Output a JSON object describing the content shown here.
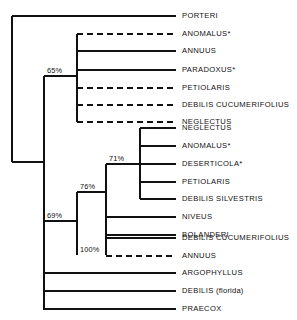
{
  "figure": {
    "type": "phylogenetic-tree",
    "background_color": "#ffffff",
    "line_color": "#111111",
    "width": 297,
    "height": 320
  },
  "chart_data": {
    "type": "tree",
    "title": "",
    "xlabel": "",
    "ylabel": "",
    "tips": [
      {
        "id": "t1",
        "label": "PORTERI",
        "qualifier": "",
        "style": "solid",
        "y": 16
      },
      {
        "id": "t2",
        "label": "ANOMALUS*",
        "qualifier": "",
        "style": "dashed",
        "y": 34
      },
      {
        "id": "t3",
        "label": "ANNUUS",
        "qualifier": "",
        "style": "solid",
        "y": 51
      },
      {
        "id": "t4",
        "label": "PARADOXUS*",
        "qualifier": "",
        "style": "solid",
        "y": 70
      },
      {
        "id": "t5",
        "label": "PETIOLARIS",
        "qualifier": "",
        "style": "dashed",
        "y": 88
      },
      {
        "id": "t6",
        "label": "DEBILIS CUCUMERIFOLIUS",
        "qualifier": "",
        "style": "dashed",
        "y": 105
      },
      {
        "id": "t7",
        "label": "NEGLECTUS",
        "qualifier": "",
        "style": "dashed",
        "y": 122
      },
      {
        "id": "t8",
        "label": "NEGLECTUS",
        "qualifier": "",
        "style": "solid",
        "y": 128
      },
      {
        "id": "t9",
        "label": "ANOMALUS*",
        "qualifier": "",
        "style": "solid",
        "y": 146
      },
      {
        "id": "t10",
        "label": "DESERTICOLA*",
        "qualifier": "",
        "style": "solid",
        "y": 164
      },
      {
        "id": "t11",
        "label": "PETIOLARIS",
        "qualifier": "",
        "style": "solid",
        "y": 182
      },
      {
        "id": "t12",
        "label": "DEBILIS SILVESTRIS",
        "qualifier": "",
        "style": "solid",
        "y": 199
      },
      {
        "id": "t13",
        "label": "NIVEUS",
        "qualifier": "",
        "style": "solid",
        "y": 217
      },
      {
        "id": "t14",
        "label": "BOLANDERI",
        "qualifier": "",
        "style": "solid",
        "y": 235
      },
      {
        "id": "t15",
        "label": "DEBILIS CUCUMERIFOLIUS",
        "qualifier": "",
        "style": "solid",
        "y": 238
      },
      {
        "id": "t16",
        "label": "ANNUUS",
        "qualifier": "",
        "style": "dashed",
        "y": 256
      },
      {
        "id": "t17",
        "label": "ARGOPHYLLUS",
        "qualifier": "",
        "style": "solid",
        "y": 273
      },
      {
        "id": "t18",
        "label": "DEBILIS",
        "qualifier": "(florida)",
        "style": "solid",
        "y": 291
      },
      {
        "id": "t19",
        "label": "PRAECOX",
        "qualifier": "",
        "style": "solid",
        "y": 309
      }
    ],
    "support_values": [
      {
        "id": "n65",
        "label": "65%",
        "x": 47,
        "y": 76
      },
      {
        "id": "n71",
        "label": "71%",
        "x": 109,
        "y": 164
      },
      {
        "id": "n76",
        "label": "76%",
        "x": 80,
        "y": 192
      },
      {
        "id": "n69",
        "label": "69%",
        "x": 47,
        "y": 221
      },
      {
        "id": "n100",
        "label": "100%",
        "x": 80,
        "y": 255
      }
    ]
  },
  "geometry": {
    "tip_x": 176,
    "label_x": 182,
    "verticals": [
      {
        "name": "root-spine",
        "x": 12,
        "y1": 16,
        "y2": 162
      },
      {
        "name": "ingroup-spine",
        "x": 44,
        "y1": 76,
        "y2": 310
      },
      {
        "name": "clade-65-spine",
        "x": 77,
        "y1": 34,
        "y2": 122
      },
      {
        "name": "clade-76-spine",
        "x": 77,
        "y1": 192,
        "y2": 255
      },
      {
        "name": "clade-71-spine",
        "x": 106,
        "y1": 164,
        "y2": 255
      },
      {
        "name": "clade-71-tipspine",
        "x": 140,
        "y1": 128,
        "y2": 199
      }
    ],
    "horizontals": [
      {
        "name": "root-to-porteri",
        "x1": 12,
        "x2": 176,
        "y": 16,
        "style": "solid"
      },
      {
        "name": "root-to-ingroup",
        "x1": 12,
        "x2": 44,
        "y": 162,
        "style": "solid"
      },
      {
        "name": "ingroup-to-65",
        "x1": 44,
        "x2": 77,
        "y": 76,
        "style": "solid"
      },
      {
        "name": "ingroup-to-69",
        "x1": 44,
        "x2": 77,
        "y": 221,
        "style": "solid"
      },
      {
        "name": "65-tip-anomalus",
        "x1": 77,
        "x2": 176,
        "y": 34,
        "style": "dashed"
      },
      {
        "name": "65-tip-annuus",
        "x1": 77,
        "x2": 176,
        "y": 51,
        "style": "solid"
      },
      {
        "name": "65-tip-paradoxus",
        "x1": 77,
        "x2": 176,
        "y": 70,
        "style": "solid"
      },
      {
        "name": "65-tip-petiolaris",
        "x1": 77,
        "x2": 176,
        "y": 88,
        "style": "dashed"
      },
      {
        "name": "65-tip-debilisc",
        "x1": 77,
        "x2": 176,
        "y": 105,
        "style": "dashed"
      },
      {
        "name": "65-tip-neglectus",
        "x1": 77,
        "x2": 176,
        "y": 122,
        "style": "dashed"
      },
      {
        "name": "76-to-71",
        "x1": 77,
        "x2": 106,
        "y": 192,
        "style": "solid"
      },
      {
        "name": "76-tip-niveus",
        "x1": 106,
        "x2": 176,
        "y": 217,
        "style": "solid"
      },
      {
        "name": "76-tip-bolanderi",
        "x1": 106,
        "x2": 176,
        "y": 235,
        "style": "solid"
      },
      {
        "name": "76-tip-debilisc",
        "x1": 106,
        "x2": 176,
        "y": 238,
        "style": "solid"
      },
      {
        "name": "100-tip-annuus",
        "x1": 106,
        "x2": 176,
        "y": 256,
        "style": "dashed"
      },
      {
        "name": "71-to-tipspine",
        "x1": 106,
        "x2": 140,
        "y": 164,
        "style": "solid"
      },
      {
        "name": "71-tip-neglectus",
        "x1": 140,
        "x2": 176,
        "y": 128,
        "style": "solid"
      },
      {
        "name": "71-tip-anomalus",
        "x1": 140,
        "x2": 176,
        "y": 146,
        "style": "solid"
      },
      {
        "name": "71-tip-deserticola",
        "x1": 140,
        "x2": 176,
        "y": 164,
        "style": "solid"
      },
      {
        "name": "71-tip-petiolaris",
        "x1": 140,
        "x2": 176,
        "y": 182,
        "style": "solid"
      },
      {
        "name": "71-tip-debiliss",
        "x1": 140,
        "x2": 176,
        "y": 199,
        "style": "solid"
      },
      {
        "name": "ingroup-tip-argo",
        "x1": 44,
        "x2": 176,
        "y": 273,
        "style": "solid"
      },
      {
        "name": "ingroup-tip-debf",
        "x1": 44,
        "x2": 176,
        "y": 291,
        "style": "solid"
      },
      {
        "name": "ingroup-tip-prae",
        "x1": 44,
        "x2": 176,
        "y": 309,
        "style": "solid"
      }
    ]
  }
}
